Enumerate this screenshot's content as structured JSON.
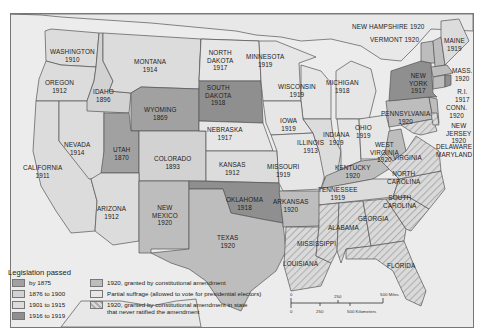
{
  "colors": {
    "by_1875": "#a1a1a1",
    "c1876_1900": "#d2d2d2",
    "c1901_1915": "#dcdcdc",
    "c1916_1919": "#8f8f8f",
    "c1920_amendment": "#bdbdbd",
    "partial": "#e6e6e6",
    "hatched_bg": "#dadada",
    "hatched_line": "#b3b3b3",
    "water": "#ececec",
    "foreign": "#e7e7e7",
    "border": "#555555"
  },
  "states": {
    "washington": {
      "name": "WASHINGTON",
      "year": "1910"
    },
    "oregon": {
      "name": "OREGON",
      "year": "1912"
    },
    "california": {
      "name": "CALIFORNIA",
      "year": "1911"
    },
    "idaho": {
      "name": "IDAHO",
      "year": "1896"
    },
    "nevada": {
      "name": "NEVADA",
      "year": "1914"
    },
    "montana": {
      "name": "MONTANA",
      "year": "1914"
    },
    "wyoming": {
      "name": "WYOMING",
      "year": "1869"
    },
    "utah": {
      "name": "UTAH",
      "year": "1870"
    },
    "colorado": {
      "name": "COLORADO",
      "year": "1893"
    },
    "arizona": {
      "name": "ARIZONA",
      "year": "1912"
    },
    "new_mexico": {
      "name1": "NEW",
      "name2": "MEXICO",
      "year": "1920"
    },
    "north_dakota": {
      "name1": "NORTH",
      "name2": "DAKOTA",
      "year": "1917"
    },
    "south_dakota": {
      "name1": "SOUTH",
      "name2": "DAKOTA",
      "year": "1918"
    },
    "nebraska": {
      "name": "NEBRASKA",
      "year": "1917"
    },
    "kansas": {
      "name": "KANSAS",
      "year": "1912"
    },
    "oklahoma": {
      "name": "OKLAHOMA",
      "year": "1918"
    },
    "texas": {
      "name": "TEXAS",
      "year": "1920"
    },
    "minnesota": {
      "name": "MINNESOTA",
      "year": "1919"
    },
    "iowa": {
      "name": "IOWA",
      "year": "1919"
    },
    "missouri": {
      "name": "MISSOURI",
      "year": "1919"
    },
    "arkansas": {
      "name": "ARKANSAS",
      "year": "1920"
    },
    "louisiana": {
      "name": "LOUISIANA"
    },
    "wisconsin": {
      "name": "WISCONSIN",
      "year": "1919"
    },
    "illinois": {
      "name": "ILLINOIS",
      "year": "1913"
    },
    "michigan": {
      "name": "MICHIGAN",
      "year": "1918"
    },
    "indiana": {
      "name": "INDIANA",
      "year": "1919"
    },
    "ohio": {
      "name": "OHIO",
      "year": "1919"
    },
    "kentucky": {
      "name": "KENTUCKY",
      "year": "1920"
    },
    "tennessee": {
      "name": "TENNESSEE",
      "year": "1919"
    },
    "mississippi": {
      "name": "MISSISSIPPI"
    },
    "alabama": {
      "name": "ALABAMA"
    },
    "georgia": {
      "name": "GEORGIA"
    },
    "florida": {
      "name": "FLORIDA"
    },
    "south_carolina": {
      "name1": "SOUTH",
      "name2": "CAROLINA"
    },
    "north_carolina": {
      "name1": "NORTH",
      "name2": "CAROLINA"
    },
    "virginia": {
      "name": "VIRGINIA"
    },
    "west_virginia": {
      "name1": "WEST",
      "name2": "VIRGINIA",
      "year": "1920"
    },
    "pennsylvania": {
      "name": "PENNSYLVANIA",
      "year": "1920"
    },
    "new_york": {
      "name1": "NEW",
      "name2": "YORK",
      "year": "1917"
    },
    "new_jersey": {
      "name1": "NEW",
      "name2": "JERSEY",
      "year": "1920"
    },
    "delaware": {
      "name": "DELAWARE"
    },
    "maryland": {
      "name": "MARYLAND"
    },
    "connecticut": {
      "name": "CONN.",
      "year": "1920"
    },
    "rhode_island": {
      "name": "R.I.",
      "year": "1917"
    },
    "massachusetts": {
      "name": "MASS.",
      "year": "1920"
    },
    "vermont": {
      "name": "VERMONT",
      "year": "1920"
    },
    "new_hampshire": {
      "name": "NEW HAMPSHIRE",
      "year": "1920"
    },
    "maine": {
      "name": "MAINE",
      "year": "1919"
    }
  },
  "legend": {
    "title": "Legislation passed",
    "items": [
      {
        "label": "by 1875",
        "color": "#a1a1a1"
      },
      {
        "label": "1876 to 1900",
        "color": "#d2d2d2"
      },
      {
        "label": "1901 to 1915",
        "color": "#dcdcdc"
      },
      {
        "label": "1916 to 1919",
        "color": "#8f8f8f"
      },
      {
        "label": "1920, granted by constitutional amendment",
        "color": "#bdbdbd"
      },
      {
        "label": "Partial suffrage (allowed to vote for presidential electors)",
        "color": "#e6e6e6"
      },
      {
        "label1": "1920, granted by constitutional amendment in state",
        "label2": "that never ratified the amendment",
        "pattern": "hatched"
      }
    ]
  },
  "scale": {
    "miles_ticks": [
      "0",
      "250",
      "500 Miles"
    ],
    "km_ticks": [
      "0",
      "250",
      "500 Kilometers"
    ]
  }
}
